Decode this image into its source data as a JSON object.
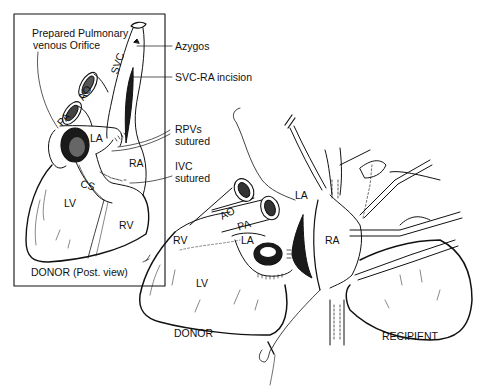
{
  "figure": {
    "inset": {
      "caption": "DONOR (Post. view)",
      "callouts": {
        "pulmonary_orifice_line1": "Prepared Pulmonary",
        "pulmonary_orifice_line2": "venous Orifice",
        "azygos": "Azygos",
        "svc_ra_incision": "SVC-RA incision",
        "rpvs_line1": "RPVs",
        "rpvs_line2": "sutured",
        "ivc_line1": "IVC",
        "ivc_line2": "sutured"
      },
      "structures": {
        "svc": "SVC",
        "ao": "AO",
        "pa": "PA",
        "la": "LA",
        "ra": "RA",
        "cs": "CS",
        "lv": "LV",
        "rv": "RV"
      }
    },
    "main": {
      "donor_caption": "DONOR",
      "recipient_caption": "RECIPIENT",
      "donor_structures": {
        "ao": "AO",
        "pa": "PA",
        "la": "LA",
        "rv": "RV",
        "lv": "LV"
      },
      "recipient_structures": {
        "la": "LA",
        "ra": "RA"
      }
    },
    "colors": {
      "ink": "#111111",
      "background": "#ffffff"
    }
  }
}
